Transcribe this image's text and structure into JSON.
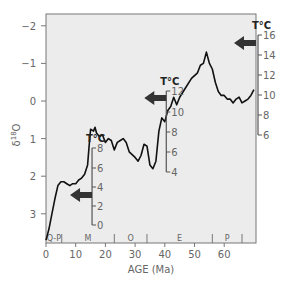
{
  "chart_data": {
    "type": "line",
    "title": "",
    "xlabel": "AGE (Ma)",
    "ylabel": "δ18O",
    "xlim": [
      0,
      70
    ],
    "ylim": [
      3.7,
      -2.3
    ],
    "y_inverted": true,
    "x_ticks": [
      0,
      10,
      20,
      30,
      40,
      50,
      60
    ],
    "y_ticks": [
      -2,
      -1,
      0,
      1,
      2,
      3
    ],
    "grid": false,
    "colors": {
      "plot_bg": "#ececec",
      "line": "#111111",
      "axis": "#777777",
      "arrow": "#333333"
    },
    "series": [
      {
        "name": "benthic δ18O",
        "x": [
          0,
          1,
          2,
          3,
          4,
          5,
          6,
          7,
          8,
          9,
          10,
          11,
          12,
          13,
          14,
          14.5,
          15,
          16,
          16.5,
          17,
          18,
          19,
          20,
          21,
          22,
          23,
          24,
          25,
          26,
          27,
          28,
          30,
          31,
          32,
          33,
          34,
          35,
          36,
          37,
          38,
          39,
          40,
          41,
          42,
          43,
          44,
          45,
          47,
          49,
          51,
          52,
          53,
          54,
          55,
          56,
          57,
          58,
          59,
          60,
          61,
          62,
          63,
          64,
          65,
          66,
          67,
          68,
          69,
          70
        ],
        "y": [
          3.7,
          3.4,
          3.0,
          2.6,
          2.25,
          2.15,
          2.15,
          2.2,
          2.25,
          2.2,
          2.2,
          2.1,
          2.05,
          1.95,
          1.7,
          1.2,
          0.75,
          0.8,
          0.7,
          0.85,
          0.95,
          0.9,
          1.1,
          1.0,
          1.05,
          1.3,
          1.1,
          1.05,
          1.0,
          1.1,
          1.35,
          1.5,
          1.6,
          1.45,
          1.15,
          1.2,
          1.7,
          1.8,
          1.6,
          0.8,
          0.45,
          0.55,
          0.25,
          0.15,
          -0.1,
          0.1,
          -0.1,
          -0.35,
          -0.6,
          -0.75,
          -0.95,
          -1.0,
          -1.3,
          -1.0,
          -0.85,
          -0.5,
          -0.25,
          -0.15,
          -0.15,
          -0.05,
          -0.05,
          0.05,
          -0.05,
          -0.1,
          0.05,
          0.0,
          -0.05,
          -0.15,
          -0.3
        ]
      }
    ],
    "epochs": [
      {
        "label": "Q-P",
        "start": 0,
        "end": 5.3
      },
      {
        "label": "M",
        "start": 5.3,
        "end": 23
      },
      {
        "label": "O",
        "start": 23,
        "end": 34
      },
      {
        "label": "E",
        "start": 34,
        "end": 56
      },
      {
        "label": "P",
        "start": 56,
        "end": 66
      }
    ],
    "temperature_scales": [
      {
        "title": "T°C",
        "age_position": 15.5,
        "ticks": [
          0,
          2,
          4,
          6,
          8
        ],
        "y_px": [
          225,
          206,
          187,
          168,
          148
        ],
        "arrow_y_px": 195
      },
      {
        "title": "T°C",
        "age_position": 40.5,
        "ticks": [
          4,
          6,
          8,
          10,
          12
        ],
        "y_px": [
          172,
          152,
          132,
          112,
          91
        ],
        "arrow_y_px": 98
      },
      {
        "title": "T°C",
        "age_position": 70,
        "ticks": [
          6,
          8,
          10,
          12,
          14,
          16
        ],
        "y_px": [
          135,
          115,
          95,
          75,
          55,
          35
        ],
        "arrow_y_px": 43
      }
    ]
  }
}
